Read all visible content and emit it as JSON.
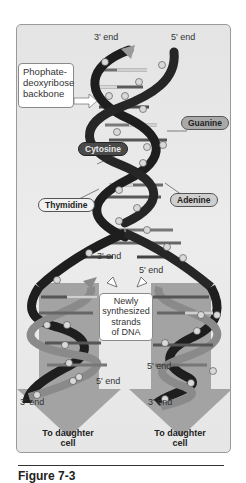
{
  "diagram": {
    "top_labels": {
      "three_prime": "3' end",
      "five_prime": "5' end"
    },
    "callout_backbone": [
      "Phophate-",
      "deoxyribose",
      "backbone"
    ],
    "bases": {
      "guanine": "Guanine",
      "cytosine": "Cytosine",
      "thymidine": "Thymidine",
      "adenine": "Adenine"
    },
    "fork_labels": {
      "three_prime": "3' end",
      "five_prime": "5' end"
    },
    "callout_new_strands": [
      "Newly",
      "synthesized",
      "strands",
      "of DNA"
    ],
    "left_daughter": {
      "end_top": "5' end",
      "end_bottom": "3' end",
      "label": [
        "To daughter",
        "cell"
      ]
    },
    "right_daughter": {
      "end_top": "5' end",
      "end_bottom": "3' end",
      "label": [
        "To daughter",
        "cell"
      ]
    },
    "phosphate_symbol": "P",
    "colors": {
      "panel_bg": "#e8e8e8",
      "parent_strand": "#1e1e1e",
      "new_strand": "#8c8c8c",
      "arrow": "#9e9e9e"
    }
  },
  "caption": {
    "text": "Figure 7-3"
  }
}
